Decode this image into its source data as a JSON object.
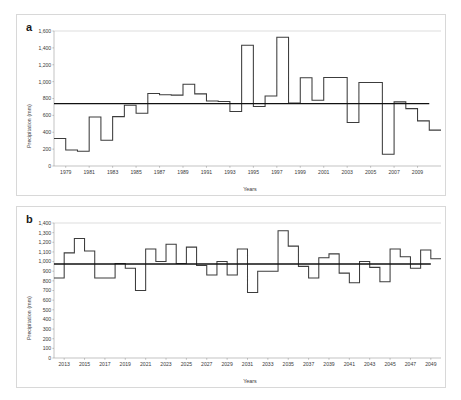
{
  "figure": {
    "background_color": "#ffffff",
    "line_color": "#3c3c3c",
    "mean_line_color": "#111111",
    "axis_color": "#9a9a9a"
  },
  "panels": {
    "a": {
      "tag": "a",
      "xlabel": "Years",
      "ylabel": "Precipitation (mm)"
    },
    "b": {
      "tag": "b",
      "xlabel": "Years",
      "ylabel": "Precipitation (mm)"
    }
  },
  "chart_data": [
    {
      "type": "line",
      "id": "panel-a",
      "title": "a",
      "subtitle": "",
      "xlabel": "Years",
      "ylabel": "Precipitation (mm)",
      "step": "post",
      "grid": false,
      "legend": "none",
      "xlim": [
        1978,
        2011
      ],
      "ylim": [
        0,
        1600
      ],
      "ytick_labels": [
        "0",
        "200",
        "400",
        "600",
        "800",
        "1,000",
        "1,200",
        "1,400",
        "1,600"
      ],
      "ytick_values": [
        0,
        200,
        400,
        600,
        800,
        1000,
        1200,
        1400,
        1600
      ],
      "xtick_labels": [
        "1979",
        "1981",
        "1983",
        "1985",
        "1987",
        "1989",
        "1991",
        "1993",
        "1995",
        "1997",
        "1999",
        "2001",
        "2003",
        "2005",
        "2007",
        "2009"
      ],
      "xtick_values": [
        1979,
        1981,
        1983,
        1985,
        1987,
        1989,
        1991,
        1993,
        1995,
        1997,
        1999,
        2001,
        2003,
        2005,
        2007,
        2009
      ],
      "series": [
        {
          "name": "Annual precipitation",
          "x": [
            1978,
            1979,
            1980,
            1981,
            1982,
            1983,
            1984,
            1985,
            1986,
            1987,
            1988,
            1989,
            1990,
            1991,
            1992,
            1993,
            1994,
            1995,
            1996,
            1997,
            1998,
            1999,
            2000,
            2001,
            2002,
            2003,
            2004,
            2005,
            2006,
            2007,
            2008,
            2009,
            2010
          ],
          "values": [
            325,
            190,
            175,
            580,
            305,
            585,
            720,
            625,
            860,
            845,
            840,
            970,
            855,
            770,
            765,
            645,
            1430,
            705,
            830,
            1525,
            745,
            1045,
            780,
            1050,
            1050,
            515,
            990,
            990,
            140,
            760,
            680,
            535,
            425
          ]
        },
        {
          "name": "Mean",
          "x": [
            1978,
            2010
          ],
          "values": [
            740,
            740
          ]
        }
      ]
    },
    {
      "type": "line",
      "id": "panel-b",
      "title": "b",
      "subtitle": "",
      "xlabel": "Years",
      "ylabel": "Precipitation (mm)",
      "step": "post",
      "grid": false,
      "legend": "none",
      "xlim": [
        2012,
        2050
      ],
      "ylim": [
        0,
        1400
      ],
      "ytick_labels": [
        "0",
        "100",
        "200",
        "300",
        "400",
        "500",
        "600",
        "700",
        "800",
        "900",
        "1,000",
        "1,100",
        "1,200",
        "1,300",
        "1,400"
      ],
      "ytick_values": [
        0,
        100,
        200,
        300,
        400,
        500,
        600,
        700,
        800,
        900,
        1000,
        1100,
        1200,
        1300,
        1400
      ],
      "xtick_labels": [
        "2013",
        "2015",
        "2017",
        "2019",
        "2021",
        "2023",
        "2025",
        "2027",
        "2029",
        "2031",
        "2033",
        "2035",
        "2037",
        "2039",
        "2041",
        "2043",
        "2045",
        "2047",
        "2049"
      ],
      "xtick_values": [
        2013,
        2015,
        2017,
        2019,
        2021,
        2023,
        2025,
        2027,
        2029,
        2031,
        2033,
        2035,
        2037,
        2039,
        2041,
        2043,
        2045,
        2047,
        2049
      ],
      "series": [
        {
          "name": "Projected precipitation",
          "x": [
            2012,
            2013,
            2014,
            2015,
            2016,
            2017,
            2018,
            2019,
            2020,
            2021,
            2022,
            2023,
            2024,
            2025,
            2026,
            2027,
            2028,
            2029,
            2030,
            2031,
            2032,
            2033,
            2034,
            2035,
            2036,
            2037,
            2038,
            2039,
            2040,
            2041,
            2042,
            2043,
            2044,
            2045,
            2046,
            2047,
            2048,
            2049
          ],
          "values": [
            830,
            1090,
            1240,
            1110,
            830,
            830,
            980,
            930,
            700,
            1130,
            1000,
            1180,
            980,
            1150,
            960,
            860,
            1000,
            860,
            1130,
            680,
            900,
            900,
            1320,
            1160,
            950,
            830,
            1040,
            1080,
            880,
            780,
            1000,
            940,
            790,
            1130,
            1050,
            930,
            1120,
            1030
          ]
        },
        {
          "name": "Mean",
          "x": [
            2012,
            2049
          ],
          "values": [
            975,
            975
          ]
        }
      ]
    }
  ]
}
